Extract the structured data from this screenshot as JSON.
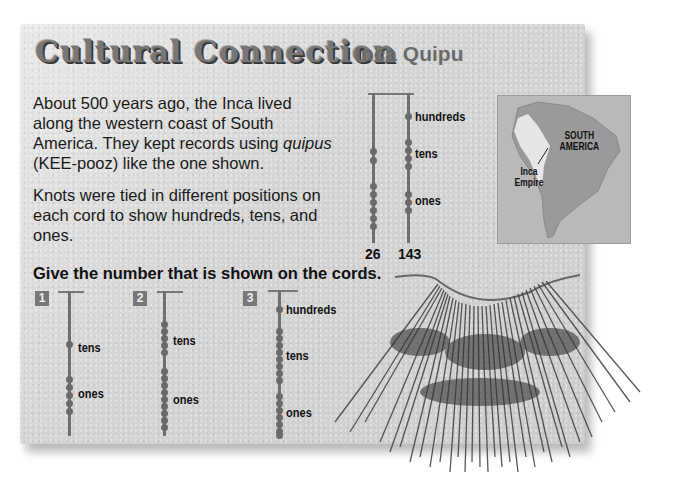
{
  "header": {
    "title": "Cultural Connection",
    "subtitle": "Inca Quipu"
  },
  "intro": {
    "paragraph1_before": "About 500 years ago, the Inca lived along the western coast of South America. They kept records using ",
    "paragraph1_italic": "quipus",
    "paragraph1_after": " (KEE-pooz) like the one shown.",
    "paragraph2": "Knots were tied in different positions on each cord to show hundreds, tens, and ones."
  },
  "example": {
    "labels": {
      "hundreds": "hundreds",
      "tens": "tens",
      "ones": "ones"
    },
    "cords": [
      {
        "value": "26",
        "hundreds": 0,
        "tens": 2,
        "ones": 6
      },
      {
        "value": "143",
        "hundreds": 1,
        "tens": 4,
        "ones": 3
      }
    ]
  },
  "map": {
    "region_label_line1": "SOUTH",
    "region_label_line2": "AMERICA",
    "empire_label_line1": "Inca",
    "empire_label_line2": "Empire"
  },
  "exercise": {
    "prompt": "Give the number that is shown on the cords.",
    "problems": [
      {
        "number": "1",
        "labels": [
          "tens",
          "ones"
        ],
        "tens": 1,
        "ones": 5
      },
      {
        "number": "2",
        "labels": [
          "tens",
          "ones"
        ],
        "tens": 5,
        "ones": 9
      },
      {
        "number": "3",
        "labels": [
          "hundreds",
          "tens",
          "ones"
        ],
        "hundreds": 1,
        "tens": 8,
        "ones": 7
      }
    ]
  },
  "colors": {
    "paper": "#d6d6d6",
    "title": "#777777",
    "cord": "#6f6f6f",
    "text": "#111111"
  }
}
